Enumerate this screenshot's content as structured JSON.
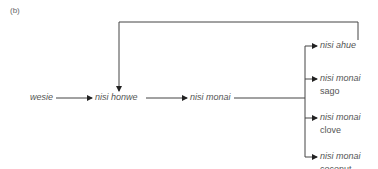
{
  "panel_label": "(b)",
  "nodes": {
    "start": "wesie",
    "middle1": "nisi honwe",
    "middle2": "nisi monai",
    "branches": [
      {
        "italic": "nisi ahue",
        "sub": ""
      },
      {
        "italic": "nisi monai",
        "sub": "sago"
      },
      {
        "italic": "nisi monai",
        "sub": "clove"
      },
      {
        "italic": "nisi monai",
        "sub": "coconut"
      }
    ]
  },
  "colors": {
    "line": "#333333",
    "text": "#555555"
  }
}
